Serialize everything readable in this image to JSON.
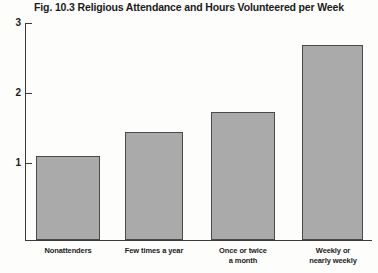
{
  "chart_data": {
    "type": "bar",
    "title": "Fig. 10.3 Religious Attendance and Hours Volunteered per Week",
    "xlabel": "",
    "ylabel": "",
    "categories": [
      "Nonattenders",
      "Few times a year",
      "Once or twice a month",
      "Weekly or nearly weekly"
    ],
    "category_lines": [
      [
        "Nonattenders"
      ],
      [
        "Few times a year"
      ],
      [
        "Once or twice",
        "a month"
      ],
      [
        "Weekly or",
        "nearly weekly"
      ]
    ],
    "values": [
      1.2,
      1.55,
      1.83,
      2.78
    ],
    "ylim": [
      0,
      3
    ],
    "yticks": [
      1,
      2,
      3
    ],
    "ytick_labels": [
      "1",
      "2",
      "3"
    ],
    "grid": false,
    "legend": null,
    "colors": {
      "bar_fill": "#aaaaaa",
      "bar_edge": "#4a4a4a",
      "axis": "#3a3a3a",
      "text": "#1b1b1b",
      "background": "#fdfdfb"
    }
  }
}
